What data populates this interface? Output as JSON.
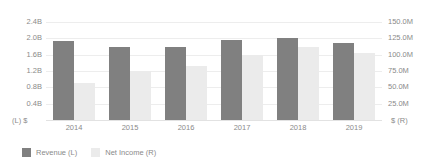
{
  "chart_data": {
    "type": "bar",
    "title": "",
    "subtitle": "",
    "xlabel": "",
    "ylabel": "",
    "grid": true,
    "legend_position": "bottom-left",
    "categories": [
      "2014",
      "2015",
      "2016",
      "2017",
      "2018",
      "2019"
    ],
    "series": [
      {
        "name": "Revenue (L)",
        "axis": "left",
        "color": "#808080",
        "unit": "B",
        "values": [
          1.93,
          1.79,
          1.79,
          1.95,
          2.02,
          1.89
        ]
      },
      {
        "name": "Net Income (R)",
        "axis": "right",
        "color": "#ebebeb",
        "unit": "M",
        "values": [
          57,
          75,
          83,
          100,
          111,
          103
        ]
      }
    ],
    "left_axis": {
      "label": "(L) $",
      "min": 0,
      "max": 2.4,
      "ticks": [
        0,
        0.4,
        0.8,
        1.2,
        1.6,
        2.0,
        2.4
      ],
      "tick_labels": [
        "$",
        "0.4B",
        "0.8B",
        "1.2B",
        "1.6B",
        "2.0B",
        "2.4B"
      ]
    },
    "right_axis": {
      "label": "$ (R)",
      "min": 0,
      "max": 150,
      "ticks": [
        0,
        25,
        50,
        75,
        100,
        125,
        150
      ],
      "tick_labels": [
        "$",
        "25.0M",
        "50.0M",
        "75.0M",
        "100.0M",
        "125.0M",
        "150.0M"
      ]
    }
  },
  "legend": {
    "items": [
      {
        "label": "Revenue (L)",
        "color": "#808080"
      },
      {
        "label": "Net Income (R)",
        "color": "#ebebeb"
      }
    ]
  },
  "colors": {
    "revenue": "#808080",
    "net_income": "#ebebeb",
    "gridline": "#ededed",
    "axis_text": "#8a8a8a",
    "background": "#ffffff"
  }
}
